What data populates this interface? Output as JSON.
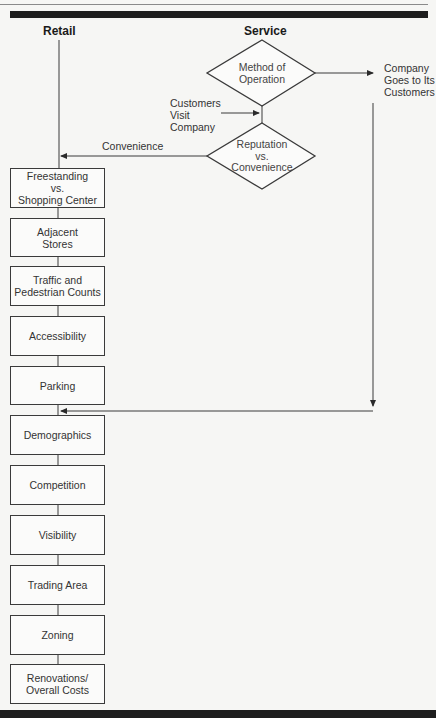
{
  "diagram": {
    "headings": {
      "retail": "Retail",
      "service": "Service"
    },
    "decisions": [
      {
        "id": "method",
        "label": "Method of\nOperation"
      },
      {
        "id": "reputation",
        "label": "Reputation\nvs.\nConvenience"
      }
    ],
    "edge_labels": {
      "company_goes": "Company\nGoes to Its\nCustomers",
      "customers_visit": "Customers\nVisit\nCompany",
      "convenience": "Convenience"
    },
    "retail_steps": [
      "Freestanding\nvs.\nShopping Center",
      "Adjacent\nStores",
      "Traffic and\nPedestrian Counts",
      "Accessibility",
      "Parking",
      "Demographics",
      "Competition",
      "Visibility",
      "Trading Area",
      "Zoning",
      "Renovations/\nOverall Costs"
    ]
  }
}
